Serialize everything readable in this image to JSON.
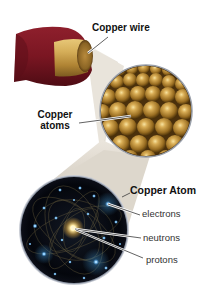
{
  "diagram": {
    "labels": {
      "wire": "Copper wire",
      "atoms_line1": "Copper",
      "atoms_line2": "atoms",
      "atom": "Copper Atom",
      "electrons": "electrons",
      "neutrons": "neutrons",
      "protons": "protons"
    },
    "colors": {
      "insulation": "#7a1622",
      "insulation_dark": "#4e0c14",
      "copper_core": "#c9a04a",
      "copper_core_dark": "#8a6424",
      "atom_sphere": "#b8862c",
      "atom_highlight": "#f2d88a",
      "beam": "#e6e1d8",
      "atom_bg": "#05070d",
      "electron_glow": "#59b7ff",
      "nucleus_glow": "#ffe9a0",
      "orbit_lines": "#8a7a4a",
      "rim": "#8f97a6",
      "leader_line": "#444444"
    }
  }
}
